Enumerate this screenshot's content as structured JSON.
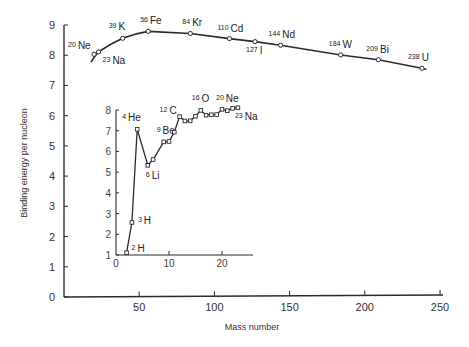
{
  "chart_data": [
    {
      "type": "line",
      "title": "",
      "xlabel": "Mass number",
      "ylabel": "Binding energy per nucleon",
      "xlim": [
        0,
        250
      ],
      "ylim": [
        0,
        9
      ],
      "xticks": [
        0,
        50,
        100,
        150,
        200,
        250
      ],
      "yticks": [
        0,
        1,
        2,
        3,
        4,
        5,
        6,
        7,
        8,
        9
      ],
      "grid": false,
      "series": [
        {
          "name": "Binding energy per nucleon (heavy nuclei)",
          "points": [
            {
              "x": 20,
              "y": 8.03,
              "label": "Ne",
              "mass": "20"
            },
            {
              "x": 23,
              "y": 8.11,
              "label": "Na",
              "mass": "23"
            },
            {
              "x": 39,
              "y": 8.56,
              "label": "K",
              "mass": "39"
            },
            {
              "x": 56,
              "y": 8.79,
              "label": "Fe",
              "mass": "56"
            },
            {
              "x": 84,
              "y": 8.72,
              "label": "Kr",
              "mass": "84"
            },
            {
              "x": 110,
              "y": 8.55,
              "label": "Cd",
              "mass": "110"
            },
            {
              "x": 127,
              "y": 8.45,
              "label": "I",
              "mass": "127"
            },
            {
              "x": 144,
              "y": 8.33,
              "label": "Nd",
              "mass": "144"
            },
            {
              "x": 184,
              "y": 8.01,
              "label": "W",
              "mass": "184"
            },
            {
              "x": 209,
              "y": 7.85,
              "label": "Bi",
              "mass": "209"
            },
            {
              "x": 238,
              "y": 7.57,
              "label": "U",
              "mass": "238"
            }
          ],
          "curve_start": {
            "x": 18,
            "y": 7.77
          }
        }
      ]
    },
    {
      "type": "line",
      "title": "Inset: light nuclei",
      "xlabel": "",
      "ylabel": "",
      "xlim": [
        0,
        25
      ],
      "ylim": [
        1,
        8
      ],
      "xticks": [
        0,
        10,
        20
      ],
      "yticks": [
        1,
        2,
        3,
        4,
        5,
        6,
        7,
        8
      ],
      "grid": false,
      "series": [
        {
          "name": "Binding energy per nucleon (light nuclei)",
          "points": [
            {
              "x": 2,
              "y": 1.11,
              "label": "H",
              "mass": "2"
            },
            {
              "x": 3,
              "y": 2.57,
              "label": "H",
              "mass": "3"
            },
            {
              "x": 4,
              "y": 7.07,
              "label": "He",
              "mass": "4"
            },
            {
              "x": 6,
              "y": 5.33,
              "label": "Li",
              "mass": "6"
            },
            {
              "x": 7,
              "y": 5.61
            },
            {
              "x": 9,
              "y": 6.46,
              "label": "Be",
              "mass": "9"
            },
            {
              "x": 10,
              "y": 6.48
            },
            {
              "x": 11,
              "y": 6.93
            },
            {
              "x": 12,
              "y": 7.68,
              "label": "C",
              "mass": "12"
            },
            {
              "x": 13,
              "y": 7.47
            },
            {
              "x": 14,
              "y": 7.48
            },
            {
              "x": 15,
              "y": 7.7
            },
            {
              "x": 16,
              "y": 7.98,
              "label": "O",
              "mass": "16"
            },
            {
              "x": 17,
              "y": 7.75
            },
            {
              "x": 18,
              "y": 7.77
            },
            {
              "x": 19,
              "y": 7.78
            },
            {
              "x": 20,
              "y": 8.03,
              "label": "Ne",
              "mass": "20"
            },
            {
              "x": 21,
              "y": 7.97
            },
            {
              "x": 22,
              "y": 8.08
            },
            {
              "x": 23,
              "y": 8.11,
              "label": "Na",
              "mass": "23"
            }
          ]
        }
      ]
    }
  ],
  "labels": {
    "xlabel": "Mass number",
    "ylabel": "Binding energy per nucleon"
  }
}
